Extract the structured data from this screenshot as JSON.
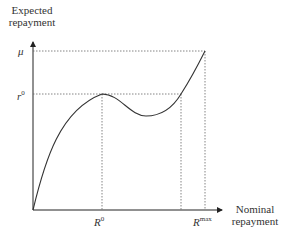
{
  "diagram": {
    "y_axis_label_line1": "Expected",
    "y_axis_label_line2": "repayment",
    "x_axis_label_line1": "Nominal",
    "x_axis_label_line2": "repayment",
    "y_ticks": [
      {
        "base": "μ",
        "sup": ""
      },
      {
        "base": "r",
        "sup": "0"
      }
    ],
    "x_ticks": [
      {
        "base": "R",
        "sup": "0"
      },
      {
        "base": "R",
        "sup": "max"
      }
    ],
    "colors": {
      "line": "#333333",
      "dotted": "#555555"
    }
  }
}
